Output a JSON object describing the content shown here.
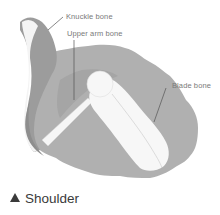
{
  "figure": {
    "labels": {
      "knuckle_bone": "Knuckle bone",
      "upper_arm_bone": "Upper arm bone",
      "blade_bone": "Blade bone"
    },
    "caption": {
      "icon": "triangle-up-icon",
      "text": "Shoulder"
    },
    "colors": {
      "shadow_gray": "#9a9a9a",
      "mid_gray": "#b5b5b5",
      "bone_white": "#f7f7f7",
      "leader_line": "#555555",
      "label_text": "#7a7a7a",
      "caption_text": "#3a3a3a"
    }
  }
}
